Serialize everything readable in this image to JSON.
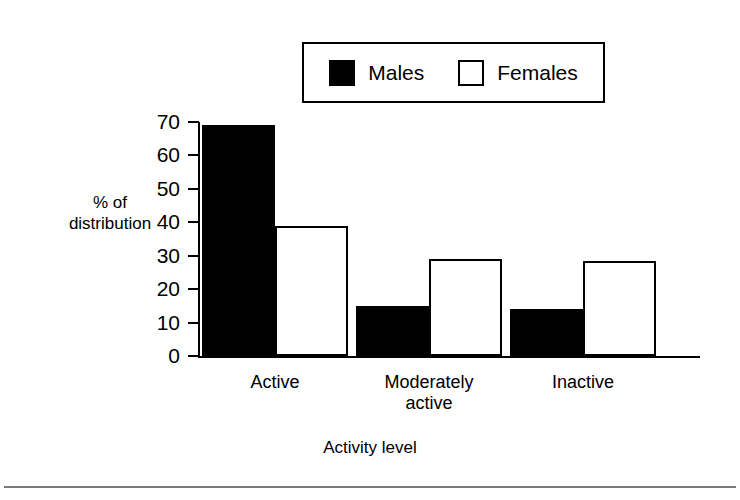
{
  "chart_data": {
    "type": "bar",
    "title": "",
    "subtitle": "",
    "xlabel": "Activity level",
    "ylabel": "% of distribution",
    "categories": [
      "Active",
      "Moderately active",
      "Inactive"
    ],
    "category_lines": [
      [
        "Active"
      ],
      [
        "Moderately",
        "active"
      ],
      [
        "Inactive"
      ]
    ],
    "series": [
      {
        "name": "Males",
        "values": [
          69,
          15,
          14
        ],
        "color": "#000000",
        "fill": "solid"
      },
      {
        "name": "Females",
        "values": [
          39,
          29,
          28.5
        ],
        "color": "#ffffff",
        "fill": "hollow"
      }
    ],
    "ylim": [
      0,
      70
    ],
    "yticks": [
      0,
      10,
      20,
      30,
      40,
      50,
      60,
      70
    ],
    "ytick_labels": [
      "0",
      "10",
      "20",
      "30",
      "40",
      "50",
      "60",
      "70"
    ],
    "grid": false,
    "legend_position": "top-center",
    "legend_entries": [
      "Males",
      "Females"
    ]
  },
  "legend": {
    "males_label": "Males",
    "females_label": "Females"
  },
  "axes": {
    "ylabel_line1": "% of",
    "ylabel_line2": "distribution",
    "xlabel": "Activity level"
  }
}
